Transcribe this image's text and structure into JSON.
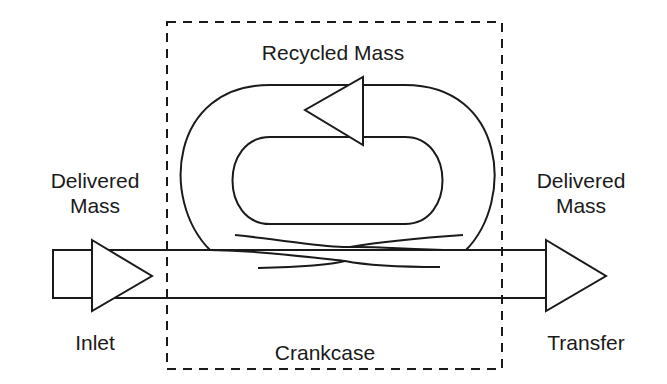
{
  "diagram": {
    "labels": {
      "inlet_delivered": [
        "Delivered",
        "Mass"
      ],
      "transfer_delivered": [
        "Delivered",
        "Mass"
      ],
      "recycled": "Recycled Mass",
      "inlet": "Inlet",
      "crankcase": "Crankcase",
      "transfer": "Transfer"
    },
    "colors": {
      "stroke": "#1a1a1a",
      "background": "#ffffff"
    }
  }
}
